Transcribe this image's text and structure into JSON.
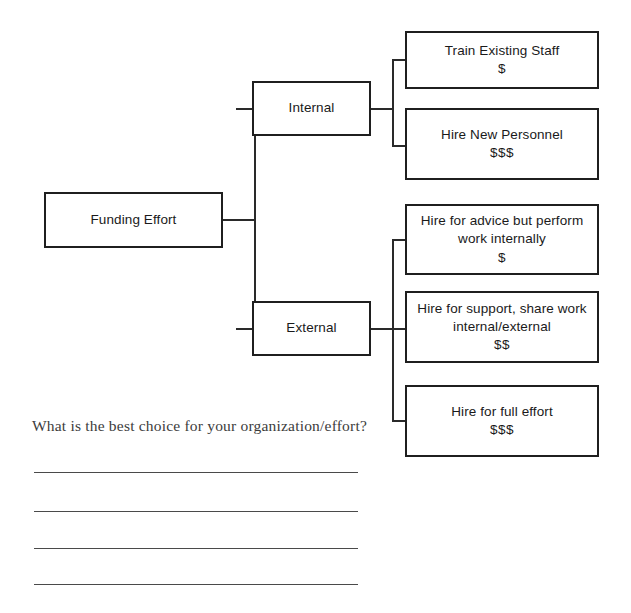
{
  "worksheet": {
    "question": "What is the best choice for your organization/effort?",
    "answer_lines": [
      "",
      "",
      "",
      ""
    ]
  },
  "diagram": {
    "type": "decision-tree",
    "root": {
      "label": "Funding Effort"
    },
    "branches": [
      {
        "label": "Internal",
        "children": [
          {
            "label": "Train Existing Staff",
            "cost": "$"
          },
          {
            "label": "Hire New Personnel",
            "cost": "$$$"
          }
        ]
      },
      {
        "label": "External",
        "children": [
          {
            "label_line1": "Hire for advice but perform",
            "label_line2": "work internally",
            "cost": "$"
          },
          {
            "label_line1": "Hire for support, share work",
            "label_line2": "internal/external",
            "cost": "$$"
          },
          {
            "label_line1": "Hire for full effort",
            "label_line2": "",
            "cost": "$$$"
          }
        ]
      }
    ]
  },
  "colors": {
    "background": "#ffffff",
    "box_border": "#1f1f1f",
    "box_text": "#1a1a1a",
    "connector": "#2a2a2a",
    "question_text": "#3c3c3c",
    "answer_rule": "#4a4a4a"
  }
}
